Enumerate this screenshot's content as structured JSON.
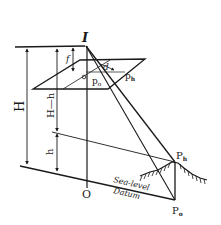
{
  "diagram": {
    "labels": {
      "exposure_station": "I",
      "focal_length": "f",
      "flying_height": "H",
      "height_above_object": "H—h",
      "object_elevation": "h",
      "displacement": "d",
      "principal_point": "o",
      "image_base_point": "p",
      "image_base_subscript": "o",
      "image_top_point": "p",
      "image_top_subscript": "h",
      "ground_nadir": "O",
      "object_top": "P",
      "object_top_subscript": "h",
      "object_base": "P",
      "object_base_subscript": "o",
      "sea_level": "Sea-level",
      "datum": "Datum"
    },
    "colors": {
      "ink": "#1a1a1a",
      "background": "#ffffff"
    }
  }
}
